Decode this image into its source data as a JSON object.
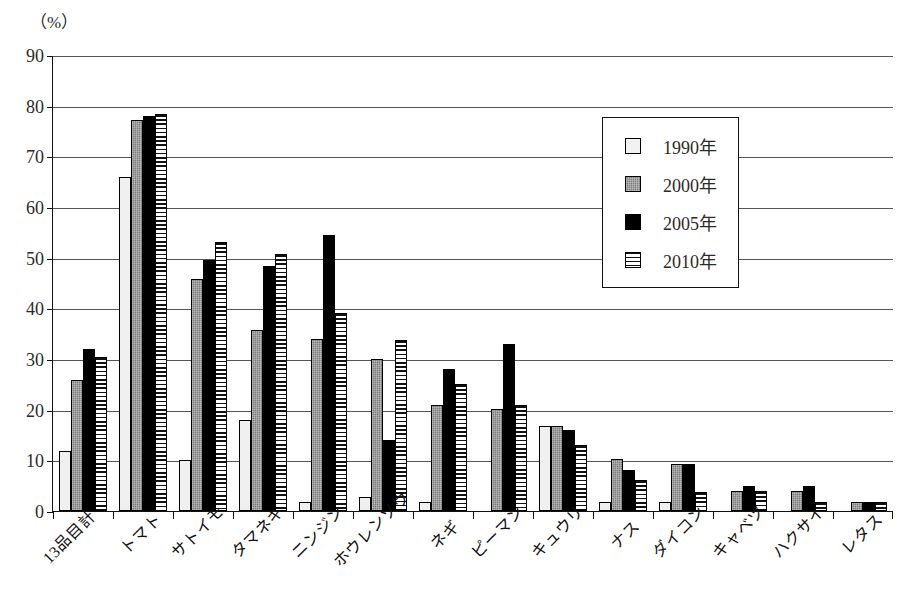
{
  "chart_data": {
    "type": "bar",
    "title": "",
    "xlabel": "",
    "ylabel": "",
    "unit_label": "（%）",
    "ylim": [
      0,
      90
    ],
    "ytick_step": 10,
    "yticks": [
      "0",
      "10",
      "20",
      "30",
      "40",
      "50",
      "60",
      "70",
      "80",
      "90"
    ],
    "grid": true,
    "legend_position": "upper-right-inside",
    "categories": [
      "13品目計",
      "トマト",
      "サトイモ",
      "タマネギ",
      "ニンジン",
      "ホウレンソウ",
      "ネギ",
      "ピーマン",
      "キュウリ",
      "ナス",
      "ダイコン",
      "キャベツ",
      "ハクサイ",
      "レタス"
    ],
    "series": [
      {
        "name": "1990年",
        "pattern": "light",
        "color": "#f0f0f0",
        "values": [
          11.8,
          66.0,
          10.1,
          18.0,
          1.7,
          2.7,
          1.7,
          0.0,
          16.8,
          1.8,
          1.8,
          0.0,
          0.0,
          0.0
        ]
      },
      {
        "name": "2000年",
        "pattern": "gray",
        "color": "#7d7d7d",
        "values": [
          25.8,
          77.2,
          45.7,
          35.7,
          34.0,
          30.0,
          21.0,
          20.2,
          16.8,
          10.2,
          9.2,
          4.0,
          4.0,
          1.8
        ]
      },
      {
        "name": "2005年",
        "pattern": "solid-black",
        "color": "#000000",
        "values": [
          32.0,
          78.0,
          49.5,
          48.4,
          54.5,
          14.0,
          28.0,
          33.0,
          16.0,
          8.0,
          9.2,
          5.0,
          5.0,
          1.8
        ]
      },
      {
        "name": "2010年",
        "pattern": "horizontal-stripes",
        "color": "#ffffff",
        "values": [
          30.3,
          78.3,
          53.1,
          50.7,
          39.0,
          33.8,
          25.0,
          20.9,
          13.0,
          6.2,
          3.7,
          4.0,
          1.8,
          1.8
        ]
      }
    ]
  }
}
